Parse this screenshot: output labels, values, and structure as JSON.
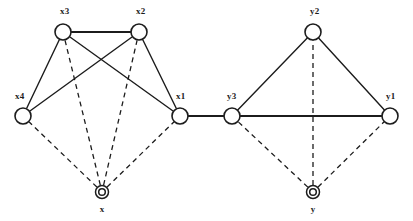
{
  "diagram": {
    "background_color": "#ffffff",
    "stroke_color": "#1c1c1c",
    "nodes": [
      {
        "id": "x3",
        "label": "x3",
        "cx": 63,
        "cy": 32,
        "r": 8,
        "type": "variable",
        "label_x": 60,
        "label_y": 14
      },
      {
        "id": "x2",
        "label": "x2",
        "cx": 139,
        "cy": 32,
        "r": 8,
        "type": "variable",
        "label_x": 136,
        "label_y": 14
      },
      {
        "id": "x4",
        "label": "x4",
        "cx": 23,
        "cy": 116,
        "r": 8,
        "type": "variable",
        "label_x": 15,
        "label_y": 99
      },
      {
        "id": "x1",
        "label": "x1",
        "cx": 180,
        "cy": 116,
        "r": 8,
        "type": "variable",
        "label_x": 176,
        "label_y": 99
      },
      {
        "id": "y2",
        "label": "y2",
        "cx": 313,
        "cy": 32,
        "r": 8,
        "type": "variable",
        "label_x": 310,
        "label_y": 14
      },
      {
        "id": "y3",
        "label": "y3",
        "cx": 232,
        "cy": 116,
        "r": 8,
        "type": "variable",
        "label_x": 227,
        "label_y": 99
      },
      {
        "id": "y1",
        "label": "y1",
        "cx": 390,
        "cy": 116,
        "r": 8,
        "type": "variable",
        "label_x": 386,
        "label_y": 99
      },
      {
        "id": "x",
        "label": "x",
        "cx": 102,
        "cy": 192,
        "r": 6.5,
        "type": "root",
        "label_x": 102,
        "label_y": 212
      },
      {
        "id": "y",
        "label": "y",
        "cx": 313,
        "cy": 192,
        "r": 6.5,
        "type": "root",
        "label_x": 313,
        "label_y": 212
      }
    ],
    "edges_solid": [
      {
        "from": "x3",
        "to": "x2",
        "style": "bold"
      },
      {
        "from": "x3",
        "to": "x4",
        "style": "plain"
      },
      {
        "from": "x3",
        "to": "x1",
        "style": "plain"
      },
      {
        "from": "x2",
        "to": "x4",
        "style": "plain"
      },
      {
        "from": "x2",
        "to": "x1",
        "style": "plain"
      },
      {
        "from": "x1",
        "to": "y3",
        "style": "bold"
      },
      {
        "from": "y3",
        "to": "y2",
        "style": "plain"
      },
      {
        "from": "y2",
        "to": "y1",
        "style": "plain"
      },
      {
        "from": "y3",
        "to": "y1",
        "style": "bold"
      }
    ],
    "edges_dashed": [
      {
        "from": "x",
        "to": "x4"
      },
      {
        "from": "x",
        "to": "x3"
      },
      {
        "from": "x",
        "to": "x2"
      },
      {
        "from": "x",
        "to": "x1"
      },
      {
        "from": "y",
        "to": "y3"
      },
      {
        "from": "y",
        "to": "y2"
      },
      {
        "from": "y",
        "to": "y1"
      }
    ]
  }
}
